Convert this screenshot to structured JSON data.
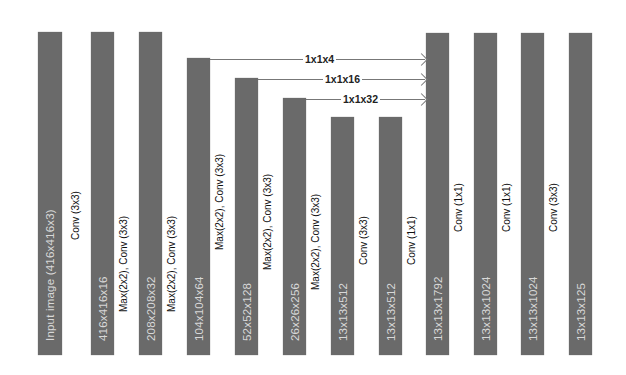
{
  "diagram": {
    "type": "cnn-architecture",
    "bar_color": "#6a6a6a",
    "layers": [
      {
        "label": "Input image (416x416x3)",
        "x": 38,
        "top": 32,
        "width": 24
      },
      {
        "label": "416x416x16",
        "x": 91,
        "top": 32,
        "width": 23
      },
      {
        "label": "208x208x32",
        "x": 139,
        "top": 32,
        "width": 23
      },
      {
        "label": "104x104x64",
        "x": 187,
        "top": 58,
        "width": 23
      },
      {
        "label": "52x52x128",
        "x": 235,
        "top": 78,
        "width": 23
      },
      {
        "label": "26x26x256",
        "x": 283,
        "top": 98,
        "width": 23
      },
      {
        "label": "13x13x512",
        "x": 331,
        "top": 117,
        "width": 23
      },
      {
        "label": "13x13x512",
        "x": 379,
        "top": 117,
        "width": 23
      },
      {
        "label": "13x13x1792",
        "x": 426,
        "top": 33,
        "width": 23
      },
      {
        "label": "13x13x1024",
        "x": 474,
        "top": 33,
        "width": 23
      },
      {
        "label": "13x13x1024",
        "x": 521,
        "top": 33,
        "width": 23
      },
      {
        "label": "13x13x125",
        "x": 569,
        "top": 33,
        "width": 23
      }
    ],
    "operations": [
      {
        "label": "Conv (3x3)",
        "x": 70,
        "bottom": 240
      },
      {
        "label": "Max(2x2), Conv (3x3)",
        "x": 118,
        "bottom": 312
      },
      {
        "label": "Max(2x2), Conv (3x3)",
        "x": 166,
        "bottom": 312
      },
      {
        "label": "Max(2x2), Conv (3x3)",
        "x": 214,
        "bottom": 250
      },
      {
        "label": "Max(2x2), Conv (3x3)",
        "x": 262,
        "bottom": 270
      },
      {
        "label": "Max(2x2), Conv (3x3)",
        "x": 310,
        "bottom": 290
      },
      {
        "label": "Conv (3x3)",
        "x": 358,
        "bottom": 265
      },
      {
        "label": "Conv (1x1)",
        "x": 406,
        "bottom": 265
      },
      {
        "label": "Conv (1x1)",
        "x": 453,
        "bottom": 232
      },
      {
        "label": "Conv (1x1)",
        "x": 501,
        "bottom": 232
      },
      {
        "label": "Conv (3x3)",
        "x": 548,
        "bottom": 232
      }
    ],
    "skip_connections": [
      {
        "label": "1x1x4",
        "from_x": 210,
        "y": 59,
        "to_x": 426,
        "label_x": 303
      },
      {
        "label": "1x1x16",
        "from_x": 258,
        "y": 79,
        "to_x": 426,
        "label_x": 323
      },
      {
        "label": "1x1x32",
        "from_x": 306,
        "y": 99,
        "to_x": 426,
        "label_x": 341
      }
    ],
    "bottom": 355
  }
}
